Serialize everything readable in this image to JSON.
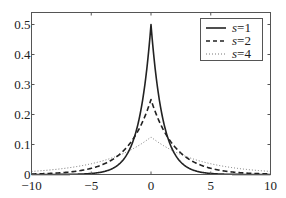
{
  "chart_data": {
    "type": "line",
    "title": "",
    "xlabel": "",
    "ylabel": "",
    "xlim": [
      -10,
      10
    ],
    "ylim": [
      0,
      0.54
    ],
    "grid": false,
    "legend_position": "upper right",
    "x_ticks": [
      "−10",
      "−5",
      "0",
      "5",
      "10"
    ],
    "x_tick_values": [
      -10,
      -5,
      0,
      5,
      10
    ],
    "y_ticks": [
      "0",
      "0.1",
      "0.2",
      "0.3",
      "0.4",
      "0.5"
    ],
    "y_tick_values": [
      0,
      0.1,
      0.2,
      0.3,
      0.4,
      0.5
    ],
    "function": "Laplace density f(x) = exp(-|x|/s) / (2s)",
    "series": [
      {
        "name": "s=1",
        "s": 1,
        "style": "solid",
        "peak": 0.5,
        "x": [
          -10,
          -8,
          -6,
          -4,
          -3,
          -2,
          -1,
          -0.5,
          0,
          0.5,
          1,
          2,
          3,
          4,
          6,
          8,
          10
        ],
        "values": [
          2.27e-05,
          0.000168,
          0.00124,
          0.00916,
          0.0249,
          0.0677,
          0.184,
          0.303,
          0.5,
          0.303,
          0.184,
          0.0677,
          0.0249,
          0.00916,
          0.00124,
          0.000168,
          2.27e-05
        ]
      },
      {
        "name": "s=2",
        "s": 2,
        "style": "dashed",
        "peak": 0.25,
        "x": [
          -10,
          -8,
          -6,
          -4,
          -3,
          -2,
          -1,
          -0.5,
          0,
          0.5,
          1,
          2,
          3,
          4,
          6,
          8,
          10
        ],
        "values": [
          0.00168,
          0.00458,
          0.0124,
          0.0338,
          0.0558,
          0.092,
          0.152,
          0.195,
          0.25,
          0.195,
          0.152,
          0.092,
          0.0558,
          0.0338,
          0.0124,
          0.00458,
          0.00168
        ]
      },
      {
        "name": "s=4",
        "s": 4,
        "style": "dotted",
        "peak": 0.125,
        "x": [
          -10,
          -8,
          -6,
          -4,
          -3,
          -2,
          -1,
          -0.5,
          0,
          0.5,
          1,
          2,
          3,
          4,
          6,
          8,
          10
        ],
        "values": [
          0.0103,
          0.0169,
          0.0279,
          0.046,
          0.059,
          0.0758,
          0.0974,
          0.11,
          0.125,
          0.11,
          0.0974,
          0.0758,
          0.059,
          0.046,
          0.0279,
          0.0169,
          0.0103
        ]
      }
    ]
  },
  "legend": {
    "items": [
      {
        "label_var": "s",
        "label_val": "=1"
      },
      {
        "label_var": "s",
        "label_val": "=2"
      },
      {
        "label_var": "s",
        "label_val": "=4"
      }
    ]
  }
}
